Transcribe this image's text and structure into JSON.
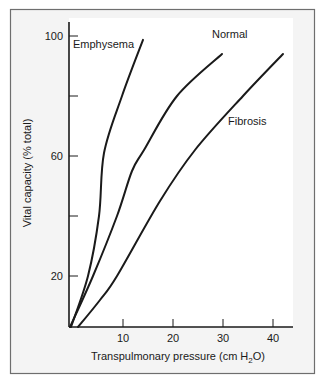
{
  "chart_data": {
    "type": "line",
    "title": "",
    "xlabel": "Transpulmonary pressure (cm H2O)",
    "xlabel_parts": {
      "pre": "Transpulmonary pressure (cm H",
      "sub": "2",
      "post": "O)"
    },
    "ylabel": "Vital capacity (% total)",
    "xlim": [
      -0.8,
      44
    ],
    "ylim": [
      3,
      105
    ],
    "x_ticks": [
      10,
      20,
      30,
      40
    ],
    "x_tick_labels": [
      "10",
      "20",
      "30",
      "40"
    ],
    "y_ticks": [
      20,
      40,
      60,
      80,
      100
    ],
    "y_tick_labels": [
      "20",
      "",
      "60",
      "",
      "100"
    ],
    "grid": false,
    "legend": "inline labels",
    "series": [
      {
        "name": "Emphysema",
        "x": [
          -0.4,
          3.0,
          5.2,
          6.2,
          9.8,
          14.0
        ],
        "y": [
          3,
          20,
          40,
          61,
          80,
          98.7
        ],
        "label_pos": [
          0.0,
          96
        ]
      },
      {
        "name": "Normal",
        "x": [
          -0.6,
          4.0,
          8.8,
          11.8,
          14.2,
          20.8,
          29.8
        ],
        "y": [
          3,
          20,
          40,
          55,
          62,
          80,
          94
        ],
        "label_pos": [
          27.8,
          99.5
        ]
      },
      {
        "name": "Fibrosis",
        "x": [
          1.0,
          5.4,
          8.8,
          17.4,
          24.4,
          34.0,
          42.0
        ],
        "y": [
          3,
          12,
          20,
          45,
          62,
          80,
          94
        ],
        "label_pos": [
          31.0,
          70.5
        ]
      }
    ]
  },
  "colors": {
    "panel_bg": "#f4f4f4",
    "plot_bg": "#ffffff",
    "border": "#6e6e6e",
    "line": "#1a1a1a"
  }
}
